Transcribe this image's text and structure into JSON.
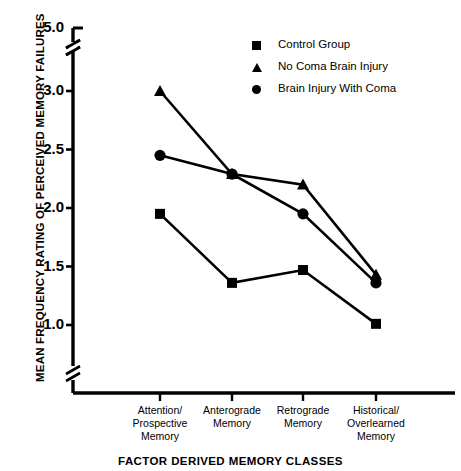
{
  "chart_data": {
    "type": "line",
    "title": "",
    "xlabel": "FACTOR DERIVED MEMORY CLASSES",
    "ylabel": "MEAN FREQUENCY RATING OF PERCEIVED MEMORY FAILURES",
    "categories": [
      "Attention/ Prospective Memory",
      "Anterograde Memory",
      "Retrograde Memory",
      "Historical/ Overlearned Memory"
    ],
    "category_lines": [
      [
        "Attention/",
        "Prospective",
        "Memory"
      ],
      [
        "Anterograde",
        "Memory"
      ],
      [
        "Retrograde",
        "Memory"
      ],
      [
        "Historical/",
        "Overlearned",
        "Memory"
      ]
    ],
    "series": [
      {
        "name": "Control Group",
        "marker": "square",
        "values": [
          1.95,
          1.36,
          1.47,
          1.01
        ]
      },
      {
        "name": "No Coma Brain Injury",
        "marker": "triangle",
        "values": [
          3.0,
          2.29,
          2.2,
          1.43
        ]
      },
      {
        "name": "Brain Injury With Coma",
        "marker": "circle",
        "values": [
          2.45,
          2.29,
          1.95,
          1.36
        ]
      }
    ],
    "ytick_labels": [
      "5.0",
      "3.0",
      "2.5",
      "2.0",
      "1.5",
      "1.0"
    ],
    "ytick_values": [
      5.0,
      3.0,
      2.5,
      2.0,
      1.5,
      1.0
    ],
    "ylim": [
      1.0,
      5.0
    ],
    "axis_breaks": [
      "above-3.0",
      "below-1.0"
    ],
    "grid": false,
    "legend_position": "top-right",
    "line_color": "#000000",
    "background_color": "#ffffff"
  },
  "legend": {
    "items": [
      {
        "label": "Control Group",
        "marker": "square"
      },
      {
        "label": "No Coma Brain Injury",
        "marker": "triangle"
      },
      {
        "label": "Brain Injury With Coma",
        "marker": "circle"
      }
    ]
  }
}
